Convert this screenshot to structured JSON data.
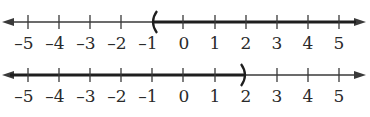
{
  "diagram": {
    "type": "number-lines",
    "colors": {
      "axis": "#3a3a3a",
      "highlight": "#1e1e1e",
      "label": "#2a2a2a"
    },
    "lines": [
      {
        "id": "top",
        "ticks": [
          "-5",
          "-4",
          "-3",
          "-2",
          "-1",
          "0",
          "1",
          "2",
          "3",
          "4",
          "5"
        ],
        "range": [
          -5,
          5
        ],
        "interval": {
          "notation": "(-1, ∞)",
          "start": -1,
          "start_symbol": "(",
          "end": "infinity",
          "direction": "right"
        }
      },
      {
        "id": "bottom",
        "ticks": [
          "-5",
          "-4",
          "-3",
          "-2",
          "-1",
          "0",
          "1",
          "2",
          "3",
          "4",
          "5"
        ],
        "range": [
          -5,
          5
        ],
        "interval": {
          "notation": "(-∞, 2)",
          "start": "-infinity",
          "end": 2,
          "end_symbol": ")",
          "direction": "left"
        }
      }
    ]
  }
}
